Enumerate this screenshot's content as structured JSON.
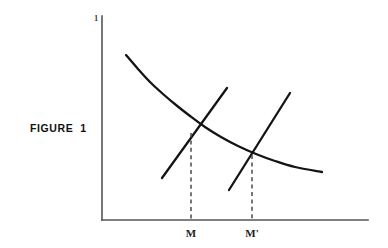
{
  "figure": {
    "caption": "FIGURE  1",
    "background_color": "#ffffff",
    "line_color": "#141414",
    "axis_color": "#55565a",
    "dash_color": "#4a4a4c"
  },
  "chart_data": {
    "type": "line",
    "title": "FIGURE  1",
    "xlabel": "",
    "ylabel": "",
    "grid": false,
    "legend": null,
    "axes": {
      "y_axis_unit_label": "1",
      "x_tick_labels": [
        "M",
        "M'"
      ],
      "x_tick_positions": [
        191,
        252
      ],
      "y_tick_labels": [],
      "origin_px": [
        102,
        220
      ],
      "x_axis_end_px": [
        368,
        220
      ],
      "y_axis_end_px": [
        102,
        16
      ]
    },
    "series": [
      {
        "name": "demand-curve",
        "kind": "curve",
        "points": [
          [
            126,
            55
          ],
          [
            138,
            69
          ],
          [
            150,
            82
          ],
          [
            163,
            94
          ],
          [
            176,
            105
          ],
          [
            190,
            116
          ],
          [
            205,
            127
          ],
          [
            221,
            137
          ],
          [
            238,
            146
          ],
          [
            256,
            154
          ],
          [
            275,
            161
          ],
          [
            295,
            167
          ],
          [
            322,
            172
          ]
        ]
      },
      {
        "name": "supply-line-1",
        "kind": "line",
        "points": [
          [
            162,
            178
          ],
          [
            227,
            88
          ]
        ]
      },
      {
        "name": "supply-line-2",
        "kind": "line",
        "points": [
          [
            229,
            190
          ],
          [
            290,
            93
          ]
        ]
      }
    ],
    "annotations": [
      {
        "name": "equilibrium-1",
        "label": "M",
        "intersection_px": [
          191,
          133
        ],
        "drop_line": [
          [
            191,
            133
          ],
          [
            191,
            219
          ]
        ]
      },
      {
        "name": "equilibrium-2",
        "label": "M'",
        "intersection_px": [
          252,
          155
        ],
        "drop_line": [
          [
            252,
            155
          ],
          [
            252,
            219
          ]
        ]
      }
    ]
  },
  "labels": {
    "y_unit": "1",
    "tick_m": "M",
    "tick_m_prime": "M'"
  }
}
